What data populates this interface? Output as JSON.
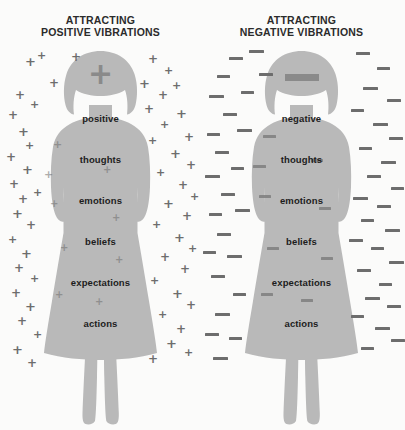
{
  "poster": {
    "background_color": "#fbfbfa",
    "silhouette_color": "#b9b9b9",
    "symbol_color": "#6d6d6d",
    "text_color": "#1d1d1d"
  },
  "panels": [
    {
      "id": "positive",
      "title": "ATTRACTING\nPOSITIVE VIBRATIONS",
      "title_line1": "ATTRACTING",
      "title_line2": "POSITIVE VIBRATIONS",
      "symbol": "+",
      "symbol_name": "plus-sign",
      "brow_symbol": "+",
      "words": [
        "positive",
        "thoughts",
        "emotions",
        "beliefs",
        "expectations",
        "actions"
      ]
    },
    {
      "id": "negative",
      "title": "ATTRACTING\nNEGATIVE VIBRATIONS",
      "title_line1": "ATTRACTING",
      "title_line2": "NEGATIVE VIBRATIONS",
      "symbol": "–",
      "symbol_name": "minus-sign",
      "brow_symbol": "–",
      "words": [
        "negative",
        "thoughts",
        "emotions",
        "beliefs",
        "expectations",
        "actions"
      ]
    }
  ],
  "layout": {
    "word_tops": [
      66,
      107,
      148,
      189,
      230,
      271
    ],
    "plus_outside": [
      [
        25,
        8,
        13
      ],
      [
        37,
        3,
        11
      ],
      [
        49,
        30,
        12
      ],
      [
        71,
        4,
        12
      ],
      [
        15,
        42,
        12
      ],
      [
        30,
        52,
        11
      ],
      [
        8,
        62,
        12
      ],
      [
        18,
        78,
        13
      ],
      [
        25,
        93,
        11
      ],
      [
        6,
        104,
        12
      ],
      [
        22,
        116,
        13
      ],
      [
        9,
        131,
        12
      ],
      [
        18,
        146,
        12
      ],
      [
        33,
        140,
        11
      ],
      [
        12,
        160,
        13
      ],
      [
        26,
        172,
        12
      ],
      [
        8,
        187,
        11
      ],
      [
        21,
        200,
        13
      ],
      [
        14,
        215,
        12
      ],
      [
        30,
        226,
        11
      ],
      [
        11,
        240,
        12
      ],
      [
        25,
        253,
        13
      ],
      [
        17,
        268,
        12
      ],
      [
        33,
        282,
        11
      ],
      [
        12,
        296,
        13
      ],
      [
        27,
        310,
        12
      ],
      [
        148,
        6,
        12
      ],
      [
        164,
        18,
        11
      ],
      [
        139,
        30,
        13
      ],
      [
        158,
        42,
        12
      ],
      [
        172,
        33,
        11
      ],
      [
        144,
        56,
        12
      ],
      [
        176,
        60,
        13
      ],
      [
        160,
        72,
        11
      ],
      [
        184,
        84,
        12
      ],
      [
        148,
        88,
        11
      ],
      [
        170,
        100,
        13
      ],
      [
        186,
        112,
        12
      ],
      [
        156,
        120,
        11
      ],
      [
        178,
        132,
        12
      ],
      [
        190,
        144,
        11
      ],
      [
        163,
        150,
        13
      ],
      [
        182,
        163,
        12
      ],
      [
        152,
        172,
        11
      ],
      [
        174,
        184,
        13
      ],
      [
        188,
        196,
        11
      ],
      [
        160,
        204,
        12
      ],
      [
        180,
        216,
        12
      ],
      [
        150,
        228,
        11
      ],
      [
        172,
        240,
        13
      ],
      [
        186,
        252,
        12
      ],
      [
        158,
        262,
        11
      ],
      [
        176,
        276,
        12
      ],
      [
        166,
        290,
        13
      ],
      [
        184,
        300,
        11
      ],
      [
        148,
        306,
        12
      ]
    ],
    "plus_inside": [
      [
        53,
        92,
        11
      ],
      [
        44,
        122,
        11
      ],
      [
        50,
        152,
        10
      ],
      [
        103,
        118,
        10
      ],
      [
        112,
        166,
        10
      ],
      [
        60,
        196,
        10
      ],
      [
        115,
        208,
        10
      ],
      [
        55,
        243,
        10
      ],
      [
        95,
        250,
        10
      ]
    ],
    "minus_outside": [
      [
        28,
        10,
        14
      ],
      [
        48,
        3,
        15
      ],
      [
        16,
        28,
        13
      ],
      [
        58,
        26,
        14
      ],
      [
        8,
        48,
        15
      ],
      [
        40,
        44,
        13
      ],
      [
        22,
        66,
        14
      ],
      [
        6,
        86,
        13
      ],
      [
        36,
        82,
        15
      ],
      [
        14,
        104,
        14
      ],
      [
        30,
        120,
        13
      ],
      [
        4,
        128,
        15
      ],
      [
        20,
        146,
        14
      ],
      [
        8,
        166,
        13
      ],
      [
        34,
        162,
        15
      ],
      [
        16,
        186,
        14
      ],
      [
        2,
        204,
        13
      ],
      [
        26,
        208,
        15
      ],
      [
        10,
        228,
        14
      ],
      [
        32,
        246,
        13
      ],
      [
        14,
        266,
        15
      ],
      [
        4,
        286,
        14
      ],
      [
        28,
        290,
        13
      ],
      [
        12,
        310,
        15
      ],
      [
        155,
        5,
        14
      ],
      [
        176,
        20,
        13
      ],
      [
        162,
        40,
        15
      ],
      [
        186,
        52,
        14
      ],
      [
        150,
        62,
        13
      ],
      [
        172,
        76,
        15
      ],
      [
        188,
        90,
        14
      ],
      [
        158,
        100,
        13
      ],
      [
        180,
        114,
        15
      ],
      [
        166,
        128,
        14
      ],
      [
        190,
        140,
        13
      ],
      [
        152,
        150,
        15
      ],
      [
        176,
        158,
        14
      ],
      [
        160,
        172,
        13
      ],
      [
        184,
        182,
        15
      ],
      [
        148,
        192,
        14
      ],
      [
        170,
        200,
        13
      ],
      [
        188,
        214,
        15
      ],
      [
        156,
        222,
        14
      ],
      [
        178,
        236,
        13
      ],
      [
        164,
        250,
        15
      ],
      [
        186,
        258,
        14
      ],
      [
        150,
        268,
        13
      ],
      [
        174,
        280,
        15
      ],
      [
        190,
        292,
        14
      ],
      [
        160,
        300,
        13
      ]
    ],
    "minus_inside": [
      [
        62,
        88,
        13
      ],
      [
        52,
        118,
        13
      ],
      [
        58,
        148,
        12
      ],
      [
        110,
        112,
        12
      ],
      [
        118,
        160,
        12
      ],
      [
        66,
        200,
        12
      ],
      [
        120,
        210,
        12
      ],
      [
        60,
        246,
        12
      ],
      [
        100,
        252,
        12
      ]
    ]
  }
}
